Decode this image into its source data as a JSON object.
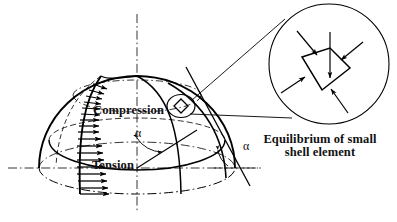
{
  "figure": {
    "type": "engineering-diagram",
    "background": "#ffffff",
    "ink": "#000000"
  },
  "labels": {
    "compression": "Compression",
    "tension": "Tension",
    "alpha_upper": "α",
    "alpha_lower": "α",
    "caption_line1": "Equilibrium of small",
    "caption_line2": "shell element",
    "caption": "Equilibrium of small\nshell element"
  },
  "dome": {
    "center_x": 137,
    "center_y": 168,
    "radius_x": 98,
    "radius_y": 92,
    "base_ellipse_ry": 26,
    "equator_ellipse_ry": 24,
    "upper_latitude_ry": 17,
    "description": "hemispherical dome drawn in axonometric projection"
  },
  "axes": {
    "vertical_axis_style": "dash-dot",
    "horizontal_axis_style": "dash-dot",
    "vertical_x": 137,
    "horizontal_y": 168
  },
  "stress_arrows": {
    "count": 18,
    "direction": "inward-normal",
    "compression_zone": "upper meridian, short arrows",
    "tension_zone": "lower meridian, long arrows",
    "transition_note": "arrow length grows from crown toward base"
  },
  "magnifier": {
    "circle_center_x": 329,
    "circle_center_y": 64,
    "circle_radius": 60,
    "element_shape": "quadrilateral shell element",
    "arrow_count": 5,
    "arrow_direction": "inward (compressive)"
  },
  "callout": {
    "source_circle_center_x": 181,
    "source_circle_center_y": 106,
    "source_circle_rx": 14,
    "source_circle_ry": 11,
    "leader_lines": 2
  }
}
